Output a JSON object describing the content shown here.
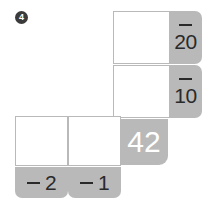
{
  "problem": {
    "number": "4",
    "marker_color": "#3b3b3b",
    "accent_color": "#b9b9b9",
    "box_border_color": "#b9b9b9"
  },
  "grid": {
    "row_labels": [
      {
        "name": "row-label-20",
        "operator": "−",
        "value": "20"
      },
      {
        "name": "row-label-10",
        "operator": "−",
        "value": "10"
      }
    ],
    "column_labels": [
      {
        "name": "column-label-2",
        "operator": "−",
        "value": "2"
      },
      {
        "name": "column-label-1",
        "operator": "−",
        "value": "1"
      }
    ],
    "answer_boxes": [
      {
        "name": "answer-box-row1",
        "value": ""
      },
      {
        "name": "answer-box-row2",
        "value": ""
      },
      {
        "name": "answer-box-bottom-left",
        "value": ""
      },
      {
        "name": "answer-box-bottom-right",
        "value": ""
      }
    ],
    "product": {
      "name": "product-total",
      "value": "42"
    }
  }
}
